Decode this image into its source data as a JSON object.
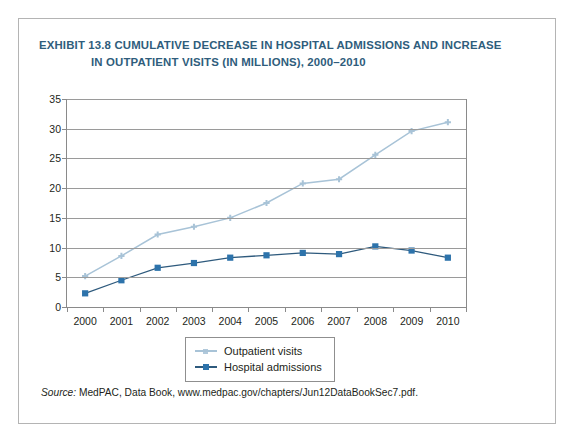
{
  "figure": {
    "title_line1": "EXHIBIT 13.8  CUMULATIVE DECREASE IN HOSPITAL ADMISSIONS AND INCREASE",
    "title_line2": "IN OUTPATIENT VISITS (IN MILLIONS), 2000–2010",
    "source_label": "Source:",
    "source_text": "MedPAC, Data Book, www.medpac.gov/chapters/Jun12DataBookSec7.pdf.",
    "title_color": "#2f5d7c",
    "border_color": "#b4b4b4"
  },
  "chart_data": {
    "type": "line",
    "title": "EXHIBIT 13.8  CUMULATIVE DECREASE IN HOSPITAL ADMISSIONS AND INCREASE IN OUTPATIENT VISITS (IN MILLIONS), 2000–2010",
    "xlabel": "",
    "ylabel": "",
    "categories": [
      "2000",
      "2001",
      "2002",
      "2003",
      "2004",
      "2005",
      "2006",
      "2007",
      "2008",
      "2009",
      "2010"
    ],
    "x": [
      2000,
      2001,
      2002,
      2003,
      2004,
      2005,
      2006,
      2007,
      2008,
      2009,
      2010
    ],
    "ylim": [
      0,
      35
    ],
    "yticks": [
      0,
      5,
      10,
      15,
      20,
      25,
      30,
      35
    ],
    "grid": true,
    "legend_position": "bottom-center",
    "series": [
      {
        "name": "Outpatient visits",
        "color": "#a8c3d7",
        "marker": "cross",
        "values": [
          5.2,
          8.6,
          12.2,
          13.5,
          15.0,
          17.5,
          20.8,
          21.5,
          25.6,
          29.6,
          31.1
        ]
      },
      {
        "name": "Hospital admissions",
        "color": "#2e5a7d",
        "marker": "square",
        "marker_color": "#2d73ab",
        "values": [
          2.3,
          4.5,
          6.6,
          7.4,
          8.3,
          8.7,
          9.1,
          8.9,
          10.2,
          9.5,
          8.3
        ]
      }
    ]
  }
}
